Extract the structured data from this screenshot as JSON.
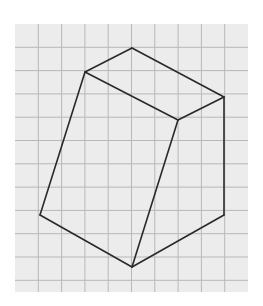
{
  "diagram": {
    "type": "geometric-figure-on-grid",
    "colors": {
      "background": "#ffffff",
      "grid_fill": "#ececec",
      "grid_line": "#b8b8b8",
      "edge": "#2a2a2a"
    },
    "grid": {
      "x0": 15,
      "y0": 24,
      "x1": 248,
      "y1": 292,
      "cell": 23.3,
      "cols": 10,
      "rows": 11.5
    },
    "vertices": {
      "A": [
        132,
        48
      ],
      "B": [
        85,
        72
      ],
      "C": [
        224,
        97
      ],
      "D": [
        178,
        120
      ],
      "E": [
        40,
        215
      ],
      "F": [
        224,
        215
      ],
      "G": [
        132,
        267
      ]
    },
    "edges": [
      [
        "A",
        "B"
      ],
      [
        "A",
        "C"
      ],
      [
        "B",
        "D"
      ],
      [
        "C",
        "D"
      ],
      [
        "B",
        "E"
      ],
      [
        "D",
        "G"
      ],
      [
        "C",
        "F"
      ],
      [
        "E",
        "G"
      ],
      [
        "F",
        "G"
      ]
    ]
  }
}
